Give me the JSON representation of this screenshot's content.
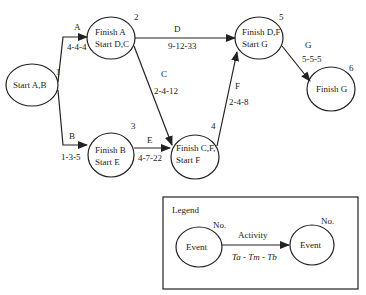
{
  "nodes": [
    {
      "no": "1",
      "line1": "Start A,B",
      "line2": ""
    },
    {
      "no": "2",
      "line1": "Finish A",
      "line2": "Start D,C"
    },
    {
      "no": "3",
      "line1": "Finish B",
      "line2": "Start E"
    },
    {
      "no": "4",
      "line1": "Finish C,F,",
      "line2": "Start F"
    },
    {
      "no": "5",
      "line1": "Finish D,F",
      "line2": "Start G"
    },
    {
      "no": "6",
      "line1": "Finish G",
      "line2": ""
    }
  ],
  "activities": [
    {
      "name": "A",
      "times": "4-4-4"
    },
    {
      "name": "B",
      "times": "1-3-5"
    },
    {
      "name": "C",
      "times": "2-4-12"
    },
    {
      "name": "D",
      "times": "9-12-33"
    },
    {
      "name": "E",
      "times": "4-7-22"
    },
    {
      "name": "F",
      "times": "2-4-8"
    },
    {
      "name": "G",
      "times": "5-5-5"
    }
  ],
  "legend": {
    "title": "Legend",
    "left_no": "No.",
    "right_no": "No.",
    "left_event": "Event",
    "right_event": "Event",
    "activity": "Activity",
    "times": "Ta - Tm - Tb"
  },
  "colors": {
    "stroke": "#222222",
    "background": "#ffffff"
  }
}
